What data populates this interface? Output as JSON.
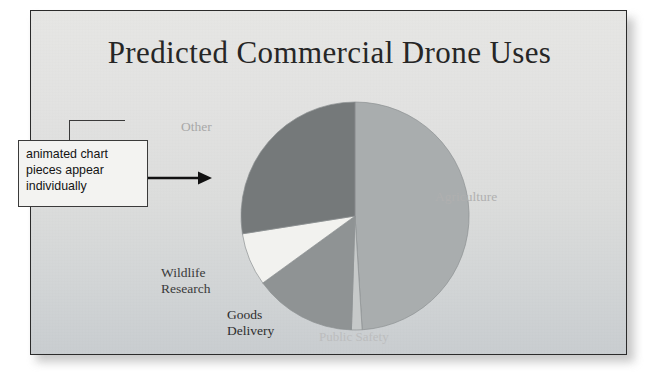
{
  "slide": {
    "title": "Predicted Commercial Drone Uses"
  },
  "annotation": {
    "text": "animated chart pieces appear individually",
    "arrow_icon": "right-arrow-icon"
  },
  "chart_data": {
    "type": "pie",
    "title": "Predicted Commercial Drone Uses",
    "categories": [
      "Agriculture",
      "Public Safety",
      "Goods Delivery",
      "Wildlife Research",
      "Other"
    ],
    "values": [
      49,
      1.5,
      14.5,
      7.5,
      27.5
    ],
    "labels": {
      "agriculture": "Agriculture",
      "public_safety": "Public Safety",
      "goods_delivery": "Goods\nDelivery",
      "wildlife_research": "Wildlife\nResearch",
      "other": "Other"
    },
    "colors": [
      "#a9adae",
      "#c6c9c9",
      "#8f9394",
      "#f2f2ef",
      "#75797a"
    ],
    "legend": "none",
    "grid": false,
    "start_angle_deg": 0,
    "direction": "clockwise",
    "center": [
      324,
      205
    ],
    "radius": 114
  },
  "style": {
    "frame_border": "#2b2b2b",
    "slide_background_top": "#e6e6e4",
    "slide_background_bottom": "#c9cdd0",
    "title_color": "#262626",
    "callout_background": "#f3f3f1",
    "callout_border": "#3a3a3a"
  }
}
